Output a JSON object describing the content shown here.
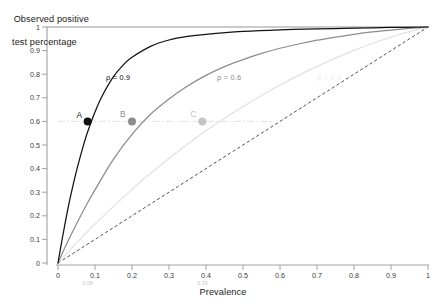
{
  "chart_data": {
    "type": "line",
    "title": "",
    "xlabel": "Prevalence",
    "ylabel": "Observed positive test percentage",
    "ylabel_line1": "Observed positive",
    "ylabel_line2": "test percentage",
    "xlim": [
      0,
      1
    ],
    "ylim": [
      0,
      1
    ],
    "grid": false,
    "legend_position": "inline-curve-labels",
    "xticks": [
      "0",
      "0.1",
      "0.2",
      "0.3",
      "0.4",
      "0.5",
      "0.6",
      "0.7",
      "0.8",
      "0.9",
      "1"
    ],
    "xtick_values": [
      0,
      0.1,
      0.2,
      0.3,
      0.4,
      0.5,
      0.6,
      0.7,
      0.8,
      0.9,
      1
    ],
    "yticks": [
      "0",
      "0.1",
      "0.2",
      "0.3",
      "0.4",
      "0.5",
      "0.6",
      "0.7",
      "0.8",
      "0.9",
      "1"
    ],
    "ytick_values": [
      0,
      0.1,
      0.2,
      0.3,
      0.4,
      0.5,
      0.6,
      0.7,
      0.8,
      0.9,
      1
    ],
    "x_sub_annotations": [
      {
        "label": "0.08",
        "value": 0.08,
        "color": "#c8c8c8"
      },
      {
        "label": "0.39",
        "value": 0.39,
        "color": "#c8c8c8"
      }
    ],
    "series": [
      {
        "name": "rho = 0.9",
        "label": "ρ = 0.9",
        "rho": 0.9,
        "color": "#111111",
        "label_x": 0.13,
        "label_y": 0.805,
        "x": [
          0,
          0.01,
          0.02,
          0.03,
          0.04,
          0.05,
          0.06,
          0.07,
          0.08,
          0.1,
          0.12,
          0.15,
          0.18,
          0.2,
          0.25,
          0.3,
          0.35,
          0.4,
          0.5,
          0.6,
          0.7,
          0.8,
          0.9,
          1
        ],
        "y": [
          0,
          0.09,
          0.175,
          0.255,
          0.325,
          0.39,
          0.45,
          0.505,
          0.555,
          0.64,
          0.71,
          0.79,
          0.845,
          0.872,
          0.918,
          0.945,
          0.96,
          0.969,
          0.981,
          0.988,
          0.992,
          0.995,
          0.998,
          1
        ]
      },
      {
        "name": "rho = 0.6",
        "label": "ρ = 0.6",
        "rho": 0.6,
        "color": "#8c8c8c",
        "label_x": 0.43,
        "label_y": 0.805,
        "x": [
          0,
          0.02,
          0.05,
          0.08,
          0.1,
          0.15,
          0.2,
          0.25,
          0.3,
          0.35,
          0.4,
          0.45,
          0.5,
          0.55,
          0.6,
          0.65,
          0.7,
          0.75,
          0.8,
          0.85,
          0.9,
          0.95,
          1
        ],
        "y": [
          0,
          0.07,
          0.165,
          0.255,
          0.31,
          0.44,
          0.545,
          0.63,
          0.695,
          0.75,
          0.795,
          0.832,
          0.862,
          0.888,
          0.91,
          0.928,
          0.944,
          0.957,
          0.969,
          0.979,
          0.987,
          0.994,
          1
        ]
      },
      {
        "name": "rho = 0.3",
        "label": "ρ = 0.3",
        "rho": 0.3,
        "color": "#e2e2e2",
        "label_x": 0.7,
        "label_y": 0.805,
        "x": [
          0,
          0.05,
          0.1,
          0.15,
          0.2,
          0.25,
          0.3,
          0.35,
          0.4,
          0.45,
          0.5,
          0.55,
          0.6,
          0.65,
          0.7,
          0.75,
          0.8,
          0.85,
          0.9,
          0.95,
          1
        ],
        "y": [
          0,
          0.085,
          0.165,
          0.24,
          0.312,
          0.38,
          0.443,
          0.503,
          0.56,
          0.613,
          0.663,
          0.71,
          0.754,
          0.795,
          0.833,
          0.868,
          0.901,
          0.931,
          0.957,
          0.98,
          1
        ]
      }
    ],
    "identity_line": {
      "name": "identity-reference-line",
      "style": "dashed",
      "color": "#333333",
      "x": [
        0,
        1
      ],
      "y": [
        0,
        1
      ]
    },
    "reference_line": {
      "name": "horizontal-reference-line",
      "style": "dash-dot",
      "color": "#dcdcdc",
      "y_value": 0.6,
      "x_start": 0.0,
      "x_end": 0.58
    },
    "points": [
      {
        "label": "A",
        "x": 0.08,
        "y": 0.6,
        "color": "#111111",
        "label_dx": -11,
        "label_dy": -5
      },
      {
        "label": "B",
        "x": 0.2,
        "y": 0.6,
        "color": "#8c8c8c",
        "label_dx": -12,
        "label_dy": -6
      },
      {
        "label": "C",
        "x": 0.39,
        "y": 0.6,
        "color": "#c4c4c4",
        "label_dx": -12,
        "label_dy": -6
      }
    ],
    "frame": {
      "left_border": true,
      "top_border": true,
      "right_border": false,
      "bottom_border": false,
      "color": "#8a8a8a"
    }
  }
}
